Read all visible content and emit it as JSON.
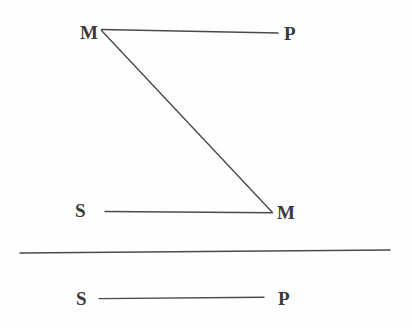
{
  "figure": {
    "background_color": "#fefefe",
    "stroke_color": "#4a4a4c",
    "text_color": "#3a3a3c",
    "premises": [
      {
        "name": "major-premise",
        "left_term": "M",
        "right_term": "P",
        "connector": "line"
      },
      {
        "name": "minor-premise",
        "left_term": "S",
        "right_term": "M",
        "connector": "line"
      }
    ],
    "middle_link": {
      "name": "middle-term-link",
      "from_term": "M",
      "to_term": "M"
    },
    "divider": {
      "name": "inference-bar"
    },
    "conclusion": {
      "name": "conclusion",
      "left_term": "S",
      "right_term": "P",
      "connector": "line"
    }
  },
  "labels": {
    "major_middle": "M",
    "major_pred": "P",
    "minor_subj": "S",
    "minor_middle": "M",
    "concl_subj": "S",
    "concl_pred": "P"
  }
}
